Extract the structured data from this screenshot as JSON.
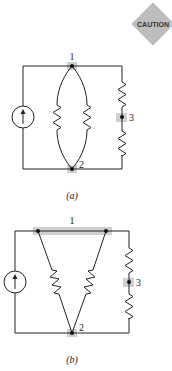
{
  "badge": {
    "text": "CAUTION",
    "fill": "#bdbdbd"
  },
  "figure_a": {
    "caption": "(a)",
    "nodes": [
      {
        "id": "1",
        "label": "1"
      },
      {
        "id": "2",
        "label": "2"
      },
      {
        "id": "3",
        "label": "3"
      }
    ]
  },
  "figure_b": {
    "caption": "(b)",
    "nodes": [
      {
        "id": "1",
        "label": "1"
      },
      {
        "id": "2",
        "label": "2"
      },
      {
        "id": "3",
        "label": "3"
      }
    ]
  },
  "colors": {
    "wire": "#222222",
    "highlight": "#cfcfcf"
  }
}
